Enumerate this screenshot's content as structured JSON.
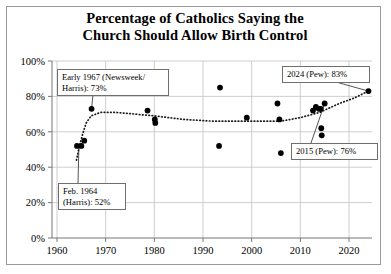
{
  "chart_data": {
    "type": "scatter",
    "title": "Percentage of Catholics Saying the Church Should Allow Birth Control",
    "title_lines": [
      "Percentage of Catholics Saying the",
      "Church Should Allow Birth Control"
    ],
    "xlabel": "",
    "ylabel": "",
    "xlim": [
      1958,
      2027
    ],
    "ylim": [
      0,
      100
    ],
    "xticks": [
      1960,
      1970,
      1980,
      1990,
      2000,
      2010,
      2020
    ],
    "xtick_labels": [
      "1960",
      "1970",
      "1980",
      "1990",
      "2000",
      "2010",
      "2020"
    ],
    "yticks": [
      0,
      20,
      40,
      60,
      80,
      100
    ],
    "ytick_labels": [
      "0%",
      "20%",
      "40%",
      "60%",
      "80%",
      "100%"
    ],
    "grid": true,
    "legend": "none",
    "marker_color": "#000000",
    "trend_style": "dotted",
    "points": [
      {
        "x": 1964.1,
        "y": 52
      },
      {
        "x": 1965.0,
        "y": 52
      },
      {
        "x": 1965.6,
        "y": 55
      },
      {
        "x": 1967.1,
        "y": 73
      },
      {
        "x": 1978.6,
        "y": 72
      },
      {
        "x": 1980.1,
        "y": 67
      },
      {
        "x": 1980.2,
        "y": 65
      },
      {
        "x": 1993.5,
        "y": 85
      },
      {
        "x": 1993.3,
        "y": 52
      },
      {
        "x": 1999.0,
        "y": 68
      },
      {
        "x": 2005.3,
        "y": 76
      },
      {
        "x": 2005.7,
        "y": 67
      },
      {
        "x": 2006.0,
        "y": 48
      },
      {
        "x": 2012.6,
        "y": 72
      },
      {
        "x": 2013.2,
        "y": 74
      },
      {
        "x": 2013.8,
        "y": 73
      },
      {
        "x": 2014.2,
        "y": 73
      },
      {
        "x": 2014.3,
        "y": 62
      },
      {
        "x": 2014.4,
        "y": 58
      },
      {
        "x": 2015.0,
        "y": 76
      },
      {
        "x": 2024.0,
        "y": 83
      }
    ],
    "trend": [
      {
        "x": 1964.0,
        "y": 44
      },
      {
        "x": 1964.6,
        "y": 52
      },
      {
        "x": 1965.3,
        "y": 59
      },
      {
        "x": 1966.0,
        "y": 65
      },
      {
        "x": 1967.0,
        "y": 69
      },
      {
        "x": 1969.0,
        "y": 71
      },
      {
        "x": 1972.0,
        "y": 71
      },
      {
        "x": 1976.0,
        "y": 70
      },
      {
        "x": 1980.0,
        "y": 69
      },
      {
        "x": 1986.0,
        "y": 67
      },
      {
        "x": 1992.0,
        "y": 66
      },
      {
        "x": 1998.0,
        "y": 66
      },
      {
        "x": 2002.0,
        "y": 66
      },
      {
        "x": 2006.0,
        "y": 66
      },
      {
        "x": 2010.0,
        "y": 68
      },
      {
        "x": 2014.0,
        "y": 71
      },
      {
        "x": 2018.0,
        "y": 76
      },
      {
        "x": 2021.0,
        "y": 79
      },
      {
        "x": 2024.0,
        "y": 83
      }
    ],
    "annotations": [
      {
        "id": "early-1967",
        "text": "Early 1967 (Newsweek/\nHarris): 73%",
        "target": {
          "x": 1967.1,
          "y": 73
        }
      },
      {
        "id": "feb-1964",
        "text": "Feb. 1964\n(Harris): 52%",
        "target": {
          "x": 1964.1,
          "y": 52
        }
      },
      {
        "id": "pew-2024",
        "text": "2024 (Pew): 83%",
        "target": {
          "x": 2024.0,
          "y": 83
        }
      },
      {
        "id": "pew-2015",
        "text": "2015 (Pew): 76%",
        "target": {
          "x": 2015.0,
          "y": 76
        }
      }
    ]
  }
}
